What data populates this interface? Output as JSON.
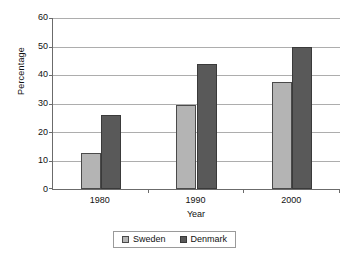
{
  "chart_data": {
    "type": "bar",
    "title": "",
    "xlabel": "Year",
    "ylabel": "Percentage",
    "categories": [
      "1980",
      "1990",
      "2000"
    ],
    "series": [
      {
        "name": "Sweden",
        "color": "#b4b4b4",
        "values": [
          12.5,
          29.5,
          37.5
        ]
      },
      {
        "name": "Denmark",
        "color": "#595959",
        "values": [
          26,
          44,
          50
        ]
      }
    ],
    "ylim": [
      0,
      60
    ],
    "ytick_step": 10,
    "yticks": [
      "60",
      "50",
      "40",
      "30",
      "20",
      "10",
      "0"
    ],
    "grid": "horizontal",
    "legend_position": "bottom",
    "legend": [
      "Sweden",
      "Denmark"
    ]
  }
}
